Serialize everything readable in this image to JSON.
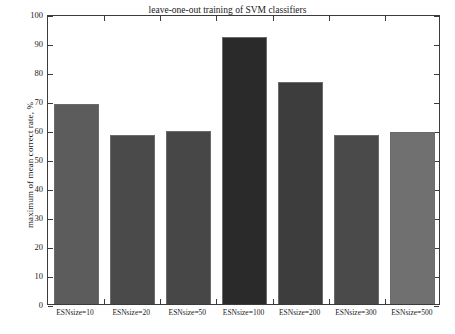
{
  "chart_data": {
    "type": "bar",
    "title": "leave-one-out training of SVM classifiers",
    "xlabel": "",
    "ylabel": "maximum of mean correct rate, %",
    "categories": [
      "ESNsize=10",
      "ESNsize=20",
      "ESNsize=50",
      "ESNsize=100",
      "ESNsize=200",
      "ESNsize=300",
      "ESNsize=500"
    ],
    "values": [
      69,
      58.4,
      59.8,
      92,
      76.5,
      58.4,
      59.2
    ],
    "ylim": [
      0,
      100
    ],
    "yticks": [
      0,
      10,
      20,
      30,
      40,
      50,
      60,
      70,
      80,
      90,
      100
    ],
    "ytick_labels": [
      "0",
      "10",
      "20",
      "30",
      "40",
      "50",
      "60",
      "70",
      "80",
      "90",
      "100"
    ],
    "grid": false,
    "legend": "none",
    "bar_colors": [
      "#5c5c5c",
      "#4a4a4a",
      "#474747",
      "#2a2a2a",
      "#3d3d3d",
      "#4a4a4a",
      "#707070"
    ],
    "bar_edge_color": "#6b6b6b",
    "axis_color": "#3b3b3b",
    "background_color": "#ffffff"
  }
}
